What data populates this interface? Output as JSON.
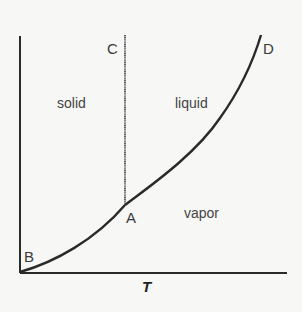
{
  "diagram": {
    "type": "phase-diagram",
    "axes": {
      "x_label": "T",
      "y_label": ""
    },
    "points": {
      "A": "A",
      "B": "B",
      "C": "C",
      "D": "D"
    },
    "regions": {
      "solid": "solid",
      "liquid": "liquid",
      "vapor": "vapor"
    },
    "colors": {
      "line": "#2a2a2a",
      "background": "#f7f7f5",
      "text": "#3a3a3a"
    }
  }
}
